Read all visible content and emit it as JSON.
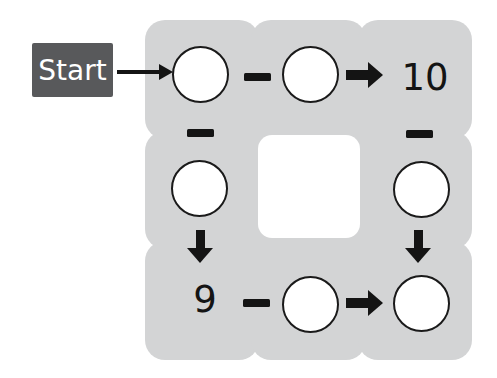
{
  "colors": {
    "page_bg": "#ffffff",
    "tile": "#d3d4d5",
    "start_box": "#58595b",
    "start_text": "#ffffff",
    "ink": "#141414",
    "circle_fill": "#ffffff",
    "circle_stroke": "#1a1a1a",
    "hole": "#ffffff"
  },
  "start": {
    "label": "Start"
  },
  "grid": {
    "rows": 3,
    "cols": 3,
    "operator_glyph": "−",
    "cells": [
      {
        "pos": "top-left",
        "content": "empty-circle"
      },
      {
        "pos": "top-middle",
        "content": "empty-circle"
      },
      {
        "pos": "top-right",
        "content": "10"
      },
      {
        "pos": "middle-left",
        "content": "empty-circle"
      },
      {
        "pos": "center",
        "content": "hole"
      },
      {
        "pos": "middle-right",
        "content": "empty-circle"
      },
      {
        "pos": "bottom-left",
        "content": "9"
      },
      {
        "pos": "bottom-middle",
        "content": "empty-circle"
      },
      {
        "pos": "bottom-right",
        "content": "empty-circle"
      }
    ],
    "connectors": [
      {
        "from": "start-label",
        "to": "top-left",
        "type": "thin-arrow-right"
      },
      {
        "from": "top-left",
        "to": "top-middle",
        "type": "minus"
      },
      {
        "from": "top-middle",
        "to": "top-right",
        "type": "arrow-right"
      },
      {
        "from": "top-left",
        "to": "middle-left",
        "type": "minus"
      },
      {
        "from": "top-right",
        "to": "middle-right",
        "type": "minus"
      },
      {
        "from": "middle-left",
        "to": "bottom-left",
        "type": "arrow-down"
      },
      {
        "from": "middle-right",
        "to": "bottom-right",
        "type": "arrow-down"
      },
      {
        "from": "bottom-left",
        "to": "bottom-middle",
        "type": "minus"
      },
      {
        "from": "bottom-middle",
        "to": "bottom-right",
        "type": "arrow-right"
      }
    ]
  }
}
